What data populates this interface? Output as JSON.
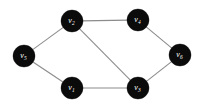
{
  "figure": {
    "type": "undirected-graph-diagram",
    "background_color": "#ffffff",
    "node_color": "#0b0b0b",
    "node_label_color": "#ffffff",
    "edge_color": "#8c8c8c",
    "node_radius": 11,
    "edge_width": 1.1,
    "width": 205,
    "height": 107
  },
  "graph": {
    "node_count": 6,
    "edge_count": 7,
    "nodes": [
      {
        "id": "v1",
        "label": "v",
        "subscript": "1",
        "x": 72,
        "y": 88,
        "position": "bottom-left"
      },
      {
        "id": "v2",
        "label": "v",
        "subscript": "2",
        "x": 72,
        "y": 21,
        "position": "top-left"
      },
      {
        "id": "v3",
        "label": "v",
        "subscript": "3",
        "x": 138,
        "y": 88,
        "position": "bottom-right"
      },
      {
        "id": "v4",
        "label": "v",
        "subscript": "4",
        "x": 138,
        "y": 20,
        "position": "top-right"
      },
      {
        "id": "v5",
        "label": "v",
        "subscript": "5",
        "x": 24,
        "y": 56,
        "position": "left"
      },
      {
        "id": "v6",
        "label": "v",
        "subscript": "6",
        "x": 180,
        "y": 55,
        "position": "right"
      }
    ],
    "edges": [
      {
        "id": "e-v5-v2",
        "source": "v5",
        "target": "v2"
      },
      {
        "id": "e-v2-v4",
        "source": "v2",
        "target": "v4"
      },
      {
        "id": "e-v4-v6",
        "source": "v4",
        "target": "v6"
      },
      {
        "id": "e-v5-v1",
        "source": "v5",
        "target": "v1"
      },
      {
        "id": "e-v1-v3",
        "source": "v1",
        "target": "v3"
      },
      {
        "id": "e-v3-v6",
        "source": "v3",
        "target": "v6"
      },
      {
        "id": "e-v2-v3",
        "source": "v2",
        "target": "v3"
      }
    ]
  }
}
